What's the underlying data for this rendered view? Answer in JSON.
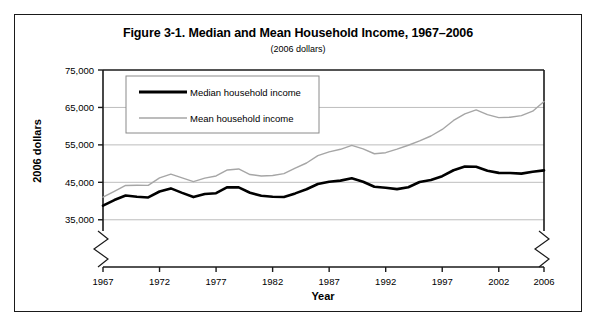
{
  "figure": {
    "title": "Figure 3-1. Median and Mean Household Income, 1967–2006",
    "subtitle": "(2006 dollars)"
  },
  "legend": {
    "median_label": "Median household income",
    "mean_label": "Mean household income"
  },
  "axis": {
    "y_title": "2006 dollars",
    "x_title": "Year",
    "y_ticks": [
      "35,000",
      "45,000",
      "55,000",
      "65,000",
      "75,000"
    ],
    "x_ticks": [
      "1967",
      "1972",
      "1977",
      "1982",
      "1987",
      "1992",
      "1997",
      "2002",
      "2006"
    ]
  },
  "colors": {
    "median_line": "#000000",
    "mean_line": "#a6a6a6",
    "gridline": "#b5b5b5",
    "axis": "#1a1a1a",
    "frame": "#1a1a1a",
    "background": "#ffffff"
  },
  "chart_data": {
    "type": "line",
    "title": "Figure 3-1. Median and Mean Household Income, 1967–2006",
    "subtitle": "(2006 dollars)",
    "xlabel": "Year",
    "ylabel": "2006 dollars",
    "xlim": [
      1967,
      2006
    ],
    "ylim": [
      32000,
      75000
    ],
    "y_ticks": [
      35000,
      45000,
      55000,
      65000,
      75000
    ],
    "x_ticks": [
      1967,
      1972,
      1977,
      1982,
      1987,
      1992,
      1997,
      2002,
      2006
    ],
    "grid": "horizontal",
    "axis_break": "both-bottom-corners",
    "legend_position": "upper-left-inside",
    "x": [
      1967,
      1968,
      1969,
      1970,
      1971,
      1972,
      1973,
      1974,
      1975,
      1976,
      1977,
      1978,
      1979,
      1980,
      1981,
      1982,
      1983,
      1984,
      1985,
      1986,
      1987,
      1988,
      1989,
      1990,
      1991,
      1992,
      1993,
      1994,
      1995,
      1996,
      1997,
      1998,
      1999,
      2000,
      2001,
      2002,
      2003,
      2004,
      2005,
      2006
    ],
    "series": [
      {
        "name": "Median household income",
        "color": "#000000",
        "linewidth": 2.6,
        "values": [
          38771,
          40261,
          41476,
          41146,
          40967,
          42544,
          43381,
          42182,
          41059,
          41880,
          42097,
          43700,
          43641,
          42208,
          41419,
          41129,
          41093,
          42043,
          43146,
          44559,
          45150,
          45455,
          46096,
          45165,
          43813,
          43564,
          43192,
          43683,
          45073,
          45613,
          46644,
          48229,
          49235,
          49163,
          48091,
          47530,
          47488,
          47323,
          47845,
          48201
        ]
      },
      {
        "name": "Mean household income",
        "color": "#a6a6a6",
        "linewidth": 1.4,
        "values": [
          41017,
          42604,
          44156,
          44199,
          44198,
          46191,
          47169,
          46168,
          45206,
          46120,
          46695,
          48311,
          48574,
          47079,
          46693,
          46838,
          47330,
          48793,
          50161,
          52130,
          53140,
          53824,
          54848,
          53946,
          52635,
          52913,
          53859,
          54900,
          56046,
          57374,
          59120,
          61530,
          63287,
          64336,
          63092,
          62276,
          62395,
          62802,
          64002,
          66570
        ]
      }
    ]
  }
}
